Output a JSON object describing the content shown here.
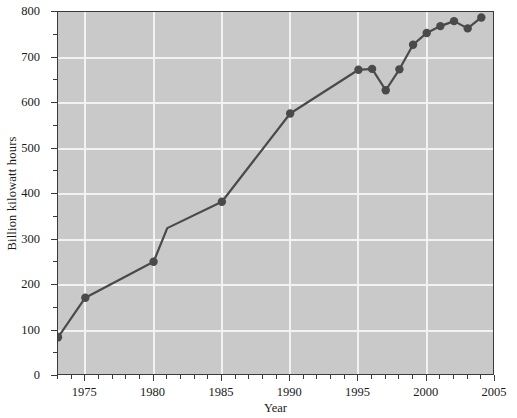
{
  "chart_data": {
    "type": "line",
    "title": "",
    "xlabel": "Year",
    "ylabel": "Billion kilowatt hours",
    "xlim": [
      1973,
      2005
    ],
    "ylim": [
      0,
      800
    ],
    "grid": true,
    "legend": null,
    "marker": "filled-circle",
    "line_color": "#4a4a4a",
    "marker_color": "#4a4a4a",
    "plot_background": "#c9c9c9",
    "gridline_color": "#f2f2f2",
    "x_ticks": [
      1975,
      1980,
      1985,
      1990,
      1995,
      2000,
      2005
    ],
    "x_tick_labels": [
      "1975",
      "1980",
      "1985",
      "1990",
      "1995",
      "2000",
      "2005"
    ],
    "x_minor_tick_interval": 1,
    "y_ticks": [
      0,
      100,
      200,
      300,
      400,
      500,
      600,
      700,
      800
    ],
    "y_tick_labels": [
      "0",
      "100",
      "200",
      "300",
      "400",
      "500",
      "600",
      "700",
      "800"
    ],
    "y_minor_tick_interval": 50,
    "x": [
      1973,
      1975,
      1980,
      1981,
      1985,
      1990,
      1995,
      1996,
      1997,
      1998,
      1999,
      2000,
      2001,
      2002,
      2003,
      2004
    ],
    "values": [
      85,
      172,
      251,
      325,
      383,
      577,
      673,
      675,
      628,
      674,
      728,
      754,
      769,
      780,
      764,
      788
    ],
    "markers_shown": [
      true,
      true,
      true,
      false,
      true,
      true,
      true,
      true,
      true,
      true,
      true,
      true,
      true,
      true,
      true,
      true
    ],
    "series": [
      {
        "name": "Billion kilowatt hours",
        "x": [
          1973,
          1975,
          1980,
          1981,
          1985,
          1990,
          1995,
          1996,
          1997,
          1998,
          1999,
          2000,
          2001,
          2002,
          2003,
          2004
        ],
        "values": [
          85,
          172,
          251,
          325,
          383,
          577,
          673,
          675,
          628,
          674,
          728,
          754,
          769,
          780,
          764,
          788
        ]
      }
    ]
  }
}
